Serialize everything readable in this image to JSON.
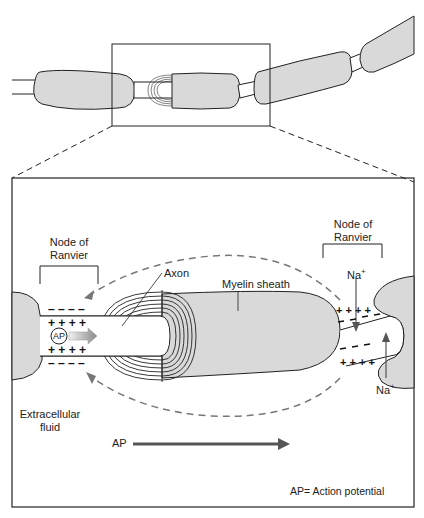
{
  "figure": {
    "colors": {
      "myelin_fill": "#d9d9d9",
      "stroke": "#222222",
      "arrow_gray": "#666666",
      "background": "#ffffff"
    }
  },
  "labels": {
    "node_left": "Node of\nRanvier",
    "node_left_line1": "Node of",
    "node_left_line2": "Ranvier",
    "node_right_line1": "Node of",
    "node_right_line2": "Ranvier",
    "axon": "Axon",
    "myelin_sheath": "Myelin sheath",
    "na_top": "Na",
    "na_top_sup": "+",
    "na_bottom": "Na",
    "na_bottom_sup": "+",
    "ap_badge": "AP",
    "extracellular_line1": "Extracellular",
    "extracellular_line2": "fluid",
    "ap_arrow_label": "AP",
    "legend": "AP= Action potential"
  },
  "charges": {
    "left_top_plus": "+ + + +",
    "left_bottom_plus": "+ + + +",
    "left_top_minus": "– – – –",
    "left_bottom_minus": "– – – –",
    "right_top_plus": "+ + + +",
    "right_bottom_plus": "+ + + +"
  }
}
